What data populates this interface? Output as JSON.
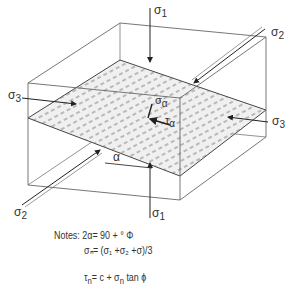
{
  "diagram": {
    "labels": {
      "sigma1_top": {
        "sym": "σ",
        "sub": "1"
      },
      "sigma1_bottom": {
        "sym": "σ",
        "sub": "1"
      },
      "sigma2_top": {
        "sym": "σ",
        "sub": "2"
      },
      "sigma2_bottom": {
        "sym": "σ",
        "sub": "2"
      },
      "sigma3_left": {
        "sym": "σ",
        "sub": "3"
      },
      "sigma3_right": {
        "sym": "σ",
        "sub": "3"
      },
      "sigma_alpha": {
        "sym": "σ",
        "sub": "α"
      },
      "tau_alpha": {
        "sym": "τ",
        "sub": "α"
      },
      "alpha": "α"
    },
    "notes": {
      "line1": "Notes: 2α= 90 + ° Φ",
      "line2": "σₙ= (σ₁ +σ₂ +σ)/3",
      "line3_tau": "τ",
      "line3_tau_sub": "n",
      "line3_mid": "=  c +  σ",
      "line3_sigma_sub": "n",
      "line3_end": " tan ϕ"
    },
    "colors": {
      "line": "#555555",
      "plane_fill": "#e4e4e4",
      "text": "#333333"
    }
  }
}
